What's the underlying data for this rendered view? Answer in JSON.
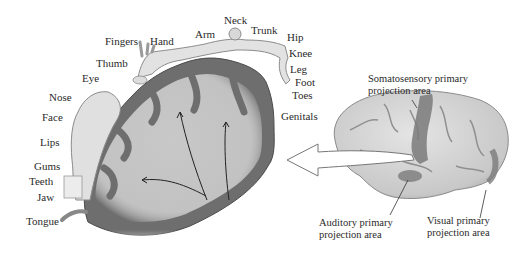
{
  "diagram": {
    "body_part_labels": [
      {
        "id": "fingers",
        "text": "Fingers",
        "x": 105,
        "y": 35
      },
      {
        "id": "hand",
        "text": "Hand",
        "x": 150,
        "y": 35
      },
      {
        "id": "arm",
        "text": "Arm",
        "x": 195,
        "y": 28
      },
      {
        "id": "neck",
        "text": "Neck",
        "x": 224,
        "y": 14
      },
      {
        "id": "trunk",
        "text": "Trunk",
        "x": 251,
        "y": 24
      },
      {
        "id": "hip",
        "text": "Hip",
        "x": 287,
        "y": 31
      },
      {
        "id": "knee",
        "text": "Knee",
        "x": 289,
        "y": 47
      },
      {
        "id": "leg",
        "text": "Leg",
        "x": 290,
        "y": 63
      },
      {
        "id": "foot",
        "text": "Foot",
        "x": 295,
        "y": 76
      },
      {
        "id": "toes",
        "text": "Toes",
        "x": 292,
        "y": 89
      },
      {
        "id": "genitals",
        "text": "Genitals",
        "x": 281,
        "y": 110
      },
      {
        "id": "thumb",
        "text": "Thumb",
        "x": 96,
        "y": 57
      },
      {
        "id": "eye",
        "text": "Eye",
        "x": 82,
        "y": 72
      },
      {
        "id": "nose",
        "text": "Nose",
        "x": 49,
        "y": 91
      },
      {
        "id": "face",
        "text": "Face",
        "x": 42,
        "y": 111
      },
      {
        "id": "lips",
        "text": "Lips",
        "x": 40,
        "y": 136
      },
      {
        "id": "gums",
        "text": "Gums",
        "x": 34,
        "y": 160
      },
      {
        "id": "teeth",
        "text": "Teeth",
        "x": 29,
        "y": 175
      },
      {
        "id": "jaw",
        "text": "Jaw",
        "x": 37,
        "y": 191
      },
      {
        "id": "tongue",
        "text": "Tongue",
        "x": 26,
        "y": 215
      }
    ],
    "area_labels": {
      "somatosensory": {
        "line1": "Somatosensory primary",
        "line2": "projection area"
      },
      "auditory": {
        "line1": "Auditory primary",
        "line2": "projection area"
      },
      "visual": {
        "line1": "Visual primary",
        "line2": "projection area"
      }
    },
    "colors": {
      "cortex_dark": "#6e6e6e",
      "white_matter": "#c4c4c4",
      "body_fill": "#e2e2e2",
      "brain_surface": "#d8d8d8",
      "highlight_area": "#7a7a7a"
    }
  }
}
